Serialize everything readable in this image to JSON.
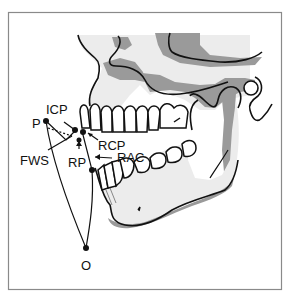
{
  "diagram": {
    "type": "anatomical-diagram",
    "labels": {
      "P": "P",
      "ICP": "ICP",
      "FWS": "FWS",
      "RP": "RP",
      "RCP": "RCP",
      "RAC": "RAC",
      "O": "O"
    },
    "colors": {
      "frame": "#8a8a8a",
      "line": "#111111",
      "bone_light": "#ececec",
      "bone_shadow": "#9a9a9a",
      "teeth": "#ffffff",
      "background": "#ffffff"
    }
  }
}
